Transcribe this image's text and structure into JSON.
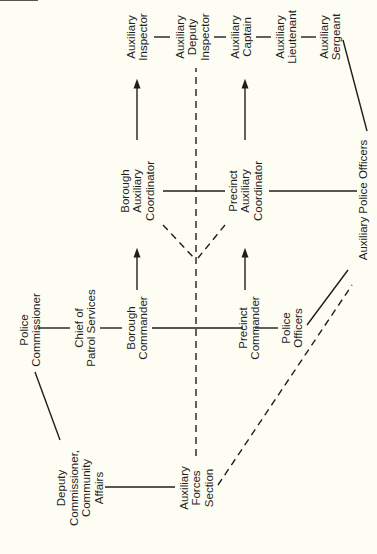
{
  "nodes": {
    "police_commissioner": [
      "Police",
      "Commissioner"
    ],
    "chief_patrol": [
      "Chief of",
      "Patrol Services"
    ],
    "borough_commander": [
      "Borough",
      "Commander"
    ],
    "precinct_commander": [
      "Precinct",
      "Commander"
    ],
    "police_officers": [
      "Police",
      "Officers"
    ],
    "deputy_commissioner": [
      "Deputy",
      "Commissioner,",
      "Community",
      "Affairs"
    ],
    "aux_forces_section": [
      "Auxiliary",
      "Forces",
      "Section"
    ],
    "borough_aux_coord": [
      "Borough",
      "Auxiliary",
      "Coordinator"
    ],
    "precinct_aux_coord": [
      "Precinct",
      "Auxiliary",
      "Coordinator"
    ],
    "aux_inspector": [
      "Auxiliary",
      "Inspector"
    ],
    "aux_deputy_inspector": [
      "Auxiliary",
      "Deputy",
      "Inspector"
    ],
    "aux_captain": [
      "Auxiliary",
      "Captain"
    ],
    "aux_lieutenant": [
      "Auxiliary",
      "Lieutenant"
    ],
    "aux_sergeant": [
      "Auxiliary",
      "Sergeant"
    ],
    "aux_police_officers": [
      "Auxiliary Police Officers"
    ]
  },
  "edges": [
    {
      "from": "police_commissioner",
      "to": "chief_patrol",
      "style": "solid"
    },
    {
      "from": "chief_patrol",
      "to": "borough_commander",
      "style": "solid"
    },
    {
      "from": "borough_commander",
      "to": "precinct_commander",
      "style": "solid"
    },
    {
      "from": "precinct_commander",
      "to": "police_officers",
      "style": "solid"
    },
    {
      "from": "police_commissioner",
      "to": "deputy_commissioner",
      "style": "solid"
    },
    {
      "from": "deputy_commissioner",
      "to": "aux_forces_section",
      "style": "solid"
    },
    {
      "from": "borough_commander",
      "to": "borough_aux_coord",
      "style": "arrow"
    },
    {
      "from": "precinct_commander",
      "to": "precinct_aux_coord",
      "style": "arrow"
    },
    {
      "from": "borough_aux_coord",
      "to": "aux_inspector",
      "style": "arrow"
    },
    {
      "from": "precinct_aux_coord",
      "to": "aux_captain",
      "style": "arrow"
    },
    {
      "from": "borough_aux_coord",
      "to": "precinct_aux_coord",
      "style": "solid"
    },
    {
      "from": "precinct_aux_coord",
      "to": "aux_police_officers",
      "style": "solid"
    },
    {
      "from": "aux_inspector",
      "to": "aux_deputy_inspector",
      "style": "solid"
    },
    {
      "from": "aux_deputy_inspector",
      "to": "aux_captain",
      "style": "solid"
    },
    {
      "from": "aux_captain",
      "to": "aux_lieutenant",
      "style": "solid"
    },
    {
      "from": "aux_lieutenant",
      "to": "aux_sergeant",
      "style": "solid"
    },
    {
      "from": "aux_sergeant",
      "to": "aux_police_officers",
      "style": "solid"
    },
    {
      "from": "police_officers",
      "to": "aux_police_officers",
      "style": "solid"
    },
    {
      "from": "aux_forces_section",
      "to": "aux_deputy_inspector",
      "style": "dashed"
    },
    {
      "from": "aux_forces_section",
      "to": "aux_police_officers",
      "style": "dashed"
    },
    {
      "from": "borough_aux_coord",
      "to": "aux_forces_section",
      "style": "dashed"
    },
    {
      "from": "precinct_aux_coord",
      "to": "aux_forces_section",
      "style": "dashed"
    }
  ]
}
